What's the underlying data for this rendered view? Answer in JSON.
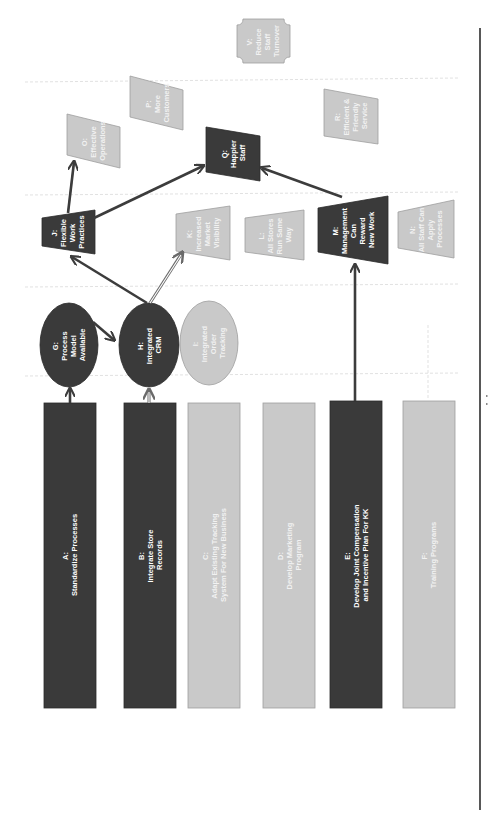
{
  "diagram": {
    "orientation": "rotated-90-ccw",
    "colors": {
      "dark_node": "#3a3a3a",
      "light_node": "#c9c9c9",
      "arrow": "#3c3c3c",
      "guide_line": "#d9d9d9"
    },
    "inputs": [
      {
        "id": "A",
        "lines": [
          "A:",
          "Standardize Processes"
        ],
        "style": "dark"
      },
      {
        "id": "B",
        "lines": [
          "B:",
          "Integrate Store",
          "Records"
        ],
        "style": "dark"
      },
      {
        "id": "C",
        "lines": [
          "C:",
          "Adapt Existing Tracking",
          "System For New Business"
        ],
        "style": "light"
      },
      {
        "id": "D",
        "lines": [
          "D:",
          "Develop Marketing",
          "Program"
        ],
        "style": "light"
      },
      {
        "id": "E",
        "lines": [
          "E:",
          "Develop Joint Compensation",
          "and Incentive Plan For KK"
        ],
        "style": "dark"
      },
      {
        "id": "F",
        "lines": [
          "F:",
          "Training Programs"
        ],
        "style": "light"
      }
    ],
    "outputs": [
      {
        "id": "G",
        "lines": [
          "G:",
          "Process",
          "Model",
          "Available"
        ],
        "style": "dark"
      },
      {
        "id": "H",
        "lines": [
          "H:",
          "Integrated",
          "CRM"
        ],
        "style": "dark"
      },
      {
        "id": "I",
        "lines": [
          "I:",
          "Integrated",
          "Order",
          "Tracking"
        ],
        "style": "light"
      }
    ],
    "outcomes": [
      {
        "id": "J",
        "lines": [
          "J:",
          "Flexible",
          "Work",
          "Practices"
        ],
        "style": "dark"
      },
      {
        "id": "K",
        "lines": [
          "K:",
          "Increased",
          "Market",
          "Visibility"
        ],
        "style": "light"
      },
      {
        "id": "L",
        "lines": [
          "L:",
          "All Stores",
          "Run Same",
          "Way"
        ],
        "style": "light"
      },
      {
        "id": "M",
        "lines": [
          "M:",
          "Management",
          "Can",
          "Reward",
          "New Work"
        ],
        "style": "dark"
      },
      {
        "id": "N",
        "lines": [
          "N:",
          "All Staff Can",
          "Apply",
          "Processes"
        ],
        "style": "light"
      }
    ],
    "benefits": [
      {
        "id": "O",
        "lines": [
          "O:",
          "Effective",
          "Operations"
        ],
        "style": "light"
      },
      {
        "id": "P",
        "lines": [
          "P:",
          "More",
          "Customers"
        ],
        "style": "light"
      },
      {
        "id": "Q",
        "lines": [
          "Q:",
          "Happier",
          "Staff"
        ],
        "style": "dark"
      },
      {
        "id": "R",
        "lines": [
          "R:",
          "Efficient &",
          "Friendly",
          "Service"
        ],
        "style": "light"
      }
    ],
    "objective": {
      "id": "V",
      "lines": [
        "V:",
        "Reduce",
        "Staff",
        "Turnover"
      ],
      "style": "light"
    },
    "edges": [
      {
        "from": "A",
        "to": "G",
        "style": "solid"
      },
      {
        "from": "B",
        "to": "H",
        "style": "double"
      },
      {
        "from": "G",
        "to": "H",
        "style": "solid"
      },
      {
        "from": "H",
        "to": "J",
        "style": "solid"
      },
      {
        "from": "H",
        "to": "K",
        "style": "double"
      },
      {
        "from": "E",
        "to": "M",
        "style": "solid"
      },
      {
        "from": "J",
        "to": "O",
        "style": "solid"
      },
      {
        "from": "J",
        "to": "Q",
        "style": "solid"
      },
      {
        "from": "M",
        "to": "Q",
        "style": "solid"
      }
    ]
  }
}
